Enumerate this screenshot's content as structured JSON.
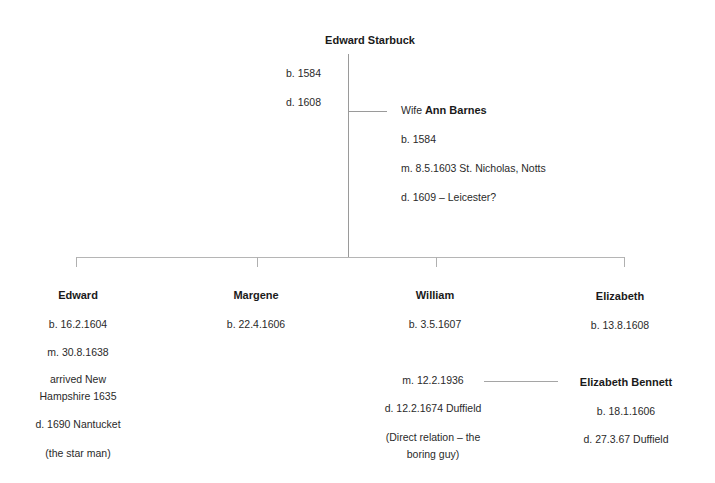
{
  "root": {
    "name": "Edward Starbuck",
    "born": "b. 1584",
    "died": "d. 1608"
  },
  "spouse": {
    "prefix": "Wife ",
    "name": "Ann Barnes",
    "born": "b. 1584",
    "married": "m. 8.5.1603 St. Nicholas, Notts",
    "died": "d. 1609 – Leicester?"
  },
  "children": [
    {
      "name": "Edward",
      "born": "b. 16.2.1604",
      "married": "m. 30.8.1638",
      "note1a": "arrived New",
      "note1b": "Hampshire 1635",
      "died": "d. 1690 Nantucket",
      "note2": "(the star man)"
    },
    {
      "name": "Margene",
      "born": "b. 22.4.1606"
    },
    {
      "name": "William",
      "born": "b. 3.5.1607",
      "married": "m. 12.2.1936",
      "died": "d. 12.2.1674 Duffield",
      "note_a": "(Direct relation – the",
      "note_b": "boring guy)"
    },
    {
      "name": "Elizabeth",
      "born": "b. 13.8.1608"
    }
  ],
  "william_spouse": {
    "name": "Elizabeth Bennett",
    "born": "b. 18.1.1606",
    "died": "d. 27.3.67 Duffield"
  }
}
